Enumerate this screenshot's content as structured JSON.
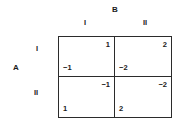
{
  "figure": {
    "type": "payoff-matrix",
    "row_player": "A",
    "col_player": "B",
    "row_strategies": [
      "I",
      "II"
    ],
    "col_strategies": [
      "I",
      "II"
    ]
  },
  "chart_data": {
    "type": "table",
    "title": "",
    "xlabel": "B",
    "ylabel": "A",
    "categories": [
      "I",
      "II"
    ],
    "row_categories": [
      "I",
      "II"
    ],
    "col_categories": [
      "I",
      "II"
    ],
    "grid": true,
    "legend": "none",
    "cells": [
      {
        "row": "I",
        "col": "I",
        "row_payoff": "−1",
        "col_payoff": "1"
      },
      {
        "row": "I",
        "col": "II",
        "row_payoff": "−2",
        "col_payoff": "2"
      },
      {
        "row": "II",
        "col": "I",
        "row_payoff": "1",
        "col_payoff": "−1"
      },
      {
        "row": "II",
        "col": "II",
        "row_payoff": "2",
        "col_payoff": "−2"
      }
    ]
  },
  "colors": {
    "background": "#ffffff",
    "border": "#2b2b2b",
    "text": "#1a1a1a"
  }
}
